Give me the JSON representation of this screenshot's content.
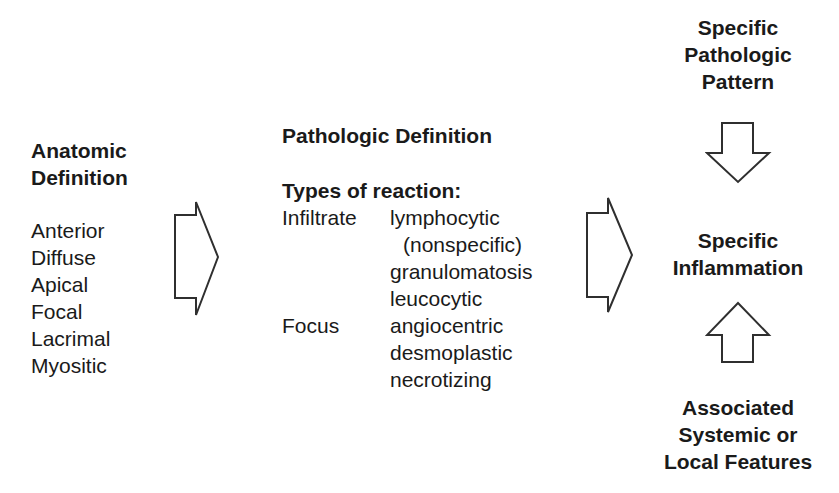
{
  "figure": {
    "background_color": "#ffffff",
    "text_color": "#1a1a1a",
    "arrow_outline_color": "#2f2f2f"
  },
  "left": {
    "heading": [
      "Anatomic",
      "Definition"
    ],
    "items": [
      "Anterior",
      "Diffuse",
      "Apical",
      "Focal",
      "Lacrimal",
      "Myositic"
    ]
  },
  "middle": {
    "heading": "Pathologic Definition",
    "subheading": "Types of reaction:",
    "rows": [
      {
        "label": "Infiltrate",
        "value": "lymphocytic"
      },
      {
        "label": "",
        "value": "(nonspecific)"
      },
      {
        "label": "",
        "value": "granulomatosis"
      },
      {
        "label": "",
        "value": "leucocytic"
      },
      {
        "label": "Focus",
        "value": "angiocentric"
      },
      {
        "label": "",
        "value": "desmoplastic"
      },
      {
        "label": "",
        "value": "necrotizing"
      }
    ]
  },
  "right": {
    "top": [
      "Specific",
      "Pathologic",
      "Pattern"
    ],
    "middle": [
      "Specific",
      "Inflammation"
    ],
    "bottom": [
      "Associated",
      "Systemic or",
      "Local Features"
    ]
  },
  "icons": {
    "right_arrow_1": "right-block-arrow",
    "right_arrow_2": "right-block-arrow",
    "down_arrow": "down-block-arrow",
    "up_arrow": "up-block-arrow"
  }
}
